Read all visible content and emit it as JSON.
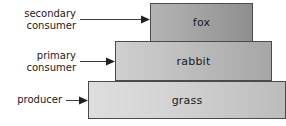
{
  "diagram": {
    "levels": [
      {
        "id": "fox",
        "label": "fox",
        "annotation": "secondary\nconsumer",
        "arrow_icon": "arrow-right-icon",
        "fill_start": "#b4b4b4",
        "fill_end": "#8f8f8f",
        "border_color": "#4a4a4a"
      },
      {
        "id": "rabbit",
        "label": "rabbit",
        "annotation": "primary\nconsumer",
        "arrow_icon": "arrow-right-icon",
        "fill_start": "#cfcfcf",
        "fill_end": "#a6a6a6",
        "border_color": "#4a4a4a"
      },
      {
        "id": "grass",
        "label": "grass",
        "annotation": "producer",
        "arrow_icon": "arrow-right-icon",
        "fill_start": "#dedede",
        "fill_end": "#bcbcbc",
        "border_color": "#4a4a4a"
      }
    ]
  }
}
